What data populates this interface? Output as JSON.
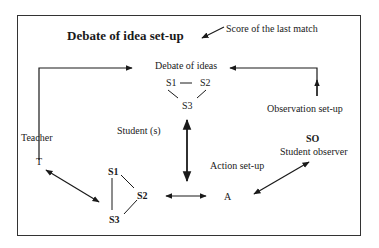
{
  "diagram": {
    "title": "Debate of idea set-up",
    "score_label": "Score of the last match",
    "debate_label": "Debate of ideas",
    "debate_nodes": [
      "S1",
      "S2",
      "S3"
    ],
    "student_label": "Student (s)",
    "teacher_label": "Teacher",
    "teacher_node": "T",
    "action_nodes": [
      "S1",
      "S2",
      "S3"
    ],
    "action_label": "Action set-up",
    "action_node": "A",
    "observation_label": "Observation set-up",
    "observer_node": "SO",
    "observer_label": "Student observer"
  }
}
